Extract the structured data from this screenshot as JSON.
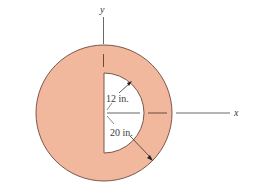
{
  "figure": {
    "axes": {
      "x_label": "x",
      "y_label": "y"
    },
    "dimensions": {
      "inner_radius_label": "12 in.",
      "outer_radius_label": "20 in."
    },
    "colors": {
      "fill": "#f2b89e",
      "outline": "#6b4a3e",
      "axis": "#555555",
      "hole": "#ffffff"
    }
  }
}
